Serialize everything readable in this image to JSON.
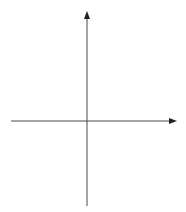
{
  "diagram": {
    "axes": {
      "x_label": "x",
      "y_label": "y"
    },
    "grid": {
      "columns": 10,
      "rows": 11,
      "origin_col": 5,
      "origin_row": 6
    },
    "points": [
      {
        "id": "p1",
        "label_main": "(x",
        "sub1": "1",
        "mid": ", y",
        "sub2": "1",
        "close": ")",
        "grid_x": -4,
        "grid_y": -2
      },
      {
        "id": "p2",
        "label_main": "(x",
        "sub1": "2",
        "mid": ", y",
        "sub2": "2",
        "close": ")",
        "grid_x": 3,
        "grid_y": 4
      },
      {
        "id": "p3",
        "label_main": "(x",
        "sub1": "2",
        "mid": ", y",
        "sub2": "1",
        "close": ")",
        "grid_x": 3,
        "grid_y": -2
      }
    ],
    "segments": [
      {
        "label": "d",
        "from": "p1",
        "to": "p2"
      },
      {
        "label": "a",
        "from": "p3",
        "to": "p2"
      },
      {
        "label": "b",
        "from": "p1",
        "to": "p3"
      }
    ],
    "colors": {
      "triangle": "#2b9ba8",
      "grid": "#d4d4d4",
      "axis": "#4a4a4a",
      "point": "#111111"
    }
  }
}
